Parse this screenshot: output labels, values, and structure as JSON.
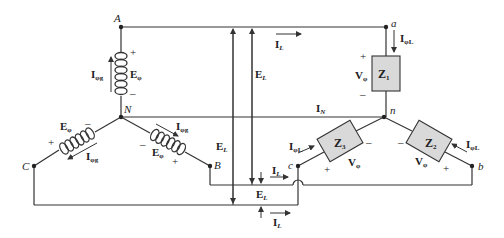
{
  "diagram": {
    "colors": {
      "wire": "#333333",
      "impedance_fill": "#d9d9d9",
      "text": "#222222"
    },
    "generator": {
      "nodes": {
        "A": "A",
        "N": "N",
        "B": "B",
        "C": "C"
      },
      "coils": [
        {
          "phase": "A",
          "voltage": "E",
          "voltage_sub": "φ",
          "current": "I",
          "current_sub": "φg",
          "plus": "+",
          "minus": "–"
        },
        {
          "phase": "B",
          "voltage": "E",
          "voltage_sub": "φ",
          "current": "I",
          "current_sub": "φg",
          "plus": "+",
          "minus": "–"
        },
        {
          "phase": "C",
          "voltage": "E",
          "voltage_sub": "φ",
          "current": "I",
          "current_sub": "φg",
          "plus": "+",
          "minus": "–"
        }
      ]
    },
    "load": {
      "nodes": {
        "a": "a",
        "n": "n",
        "b": "b",
        "c": "c"
      },
      "impedances": [
        {
          "name": "Z",
          "sub": "1",
          "voltage": "V",
          "voltage_sub": "φ",
          "current": "I",
          "current_sub": "φL",
          "plus": "+",
          "minus": "–"
        },
        {
          "name": "Z",
          "sub": "2",
          "voltage": "V",
          "voltage_sub": "φ",
          "current": "I",
          "current_sub": "φL",
          "plus": "+",
          "minus": "–"
        },
        {
          "name": "Z",
          "sub": "3",
          "voltage": "V",
          "voltage_sub": "φ",
          "current": "I",
          "current_sub": "φL",
          "plus": "+",
          "minus": "–"
        }
      ]
    },
    "lines": {
      "line_current": {
        "main": "I",
        "sub": "L"
      },
      "line_voltage": {
        "main": "E",
        "sub": "L"
      },
      "neutral_current": {
        "main": "I",
        "sub": "N"
      }
    }
  }
}
